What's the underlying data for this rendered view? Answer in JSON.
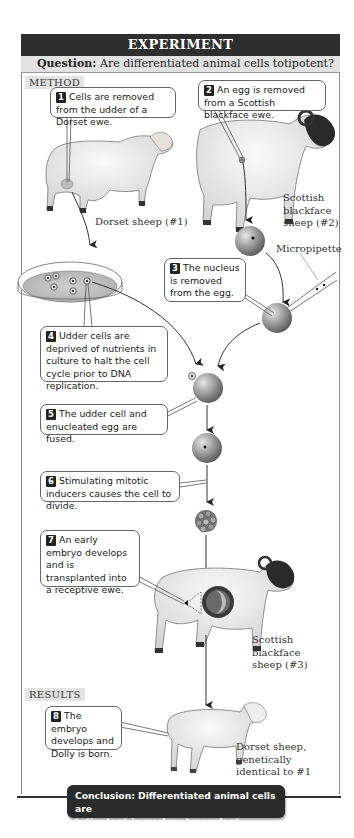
{
  "header": {
    "title": "EXPERIMENT",
    "question_label": "Question:",
    "question_text": "Are differentiated animal cells totipotent?"
  },
  "sections": {
    "method": "METHOD",
    "results": "RESULTS"
  },
  "steps": [
    {
      "number": "1",
      "text": "Cells are removed from the udder of a Dorset ewe."
    },
    {
      "number": "2",
      "text": "An egg is removed from a Scottish blackface ewe."
    },
    {
      "number": "3",
      "text": "The nucleus is removed from the egg."
    },
    {
      "number": "4",
      "text": "Udder cells are deprived of nutrients in culture to halt the cell cycle prior to DNA replication."
    },
    {
      "number": "5",
      "text": "The udder cell and enucleated egg are fused."
    },
    {
      "number": "6",
      "text": "Stimulating mitotic inducers causes the cell to divide."
    },
    {
      "number": "7",
      "text": "An early embryo develops and is transplanted into a receptive ewe."
    },
    {
      "number": "8",
      "text": "The embryo develops and Dolly is born."
    }
  ],
  "labels": {
    "dorset_sheep_1": "Dorset sheep (#1)",
    "scottish_sheep_2": [
      "Scottish",
      "blackface",
      "sheep (#2)"
    ],
    "micropipette": "Micropipette",
    "scottish_sheep_3": [
      "Scottish",
      "blackface",
      "sheep (#3)"
    ],
    "dolly": [
      "Dorset sheep,",
      "genetically",
      "identical to #1"
    ]
  },
  "conclusion": {
    "line1": "Conclusion: Differentiated animal cells are",
    "line2": "totipotent in nuclear transplant experiments."
  },
  "colors": {
    "title_bg": "#2e2e2e",
    "question_bg": "#e2e2e2",
    "section_bg": "#e4e4e4",
    "conclusion_bg": "#2b2b2b",
    "cell_gray": "#8e8e8e"
  }
}
